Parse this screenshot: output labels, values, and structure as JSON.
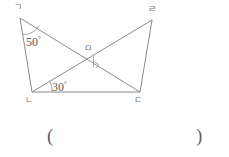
{
  "figure": {
    "title": "",
    "vertices": [
      {
        "id": "top-left",
        "label": "ㄱ",
        "x": 20,
        "y": 18,
        "label_x": 14,
        "label_y": 3
      },
      {
        "id": "top-right",
        "label": "ㄹ",
        "x": 152,
        "y": 20,
        "label_x": 148,
        "label_y": 5
      },
      {
        "id": "bottom-left",
        "label": "ㄴ",
        "x": 32,
        "y": 92,
        "label_x": 25,
        "label_y": 96
      },
      {
        "id": "bottom-right",
        "label": "ㄷ",
        "x": 140,
        "y": 92,
        "label_x": 134,
        "label_y": 96
      },
      {
        "id": "intersection",
        "label": "ㅁ",
        "x": 88,
        "y": 58,
        "label_x": 84,
        "label_y": 44
      }
    ],
    "segments": [
      {
        "id": "seg-gn",
        "from": "top-left",
        "to": "bottom-left"
      },
      {
        "id": "seg-gd",
        "from": "top-left",
        "to": "bottom-right"
      },
      {
        "id": "seg-nd",
        "from": "bottom-left",
        "to": "bottom-right"
      },
      {
        "id": "seg-nr",
        "from": "bottom-left",
        "to": "top-right"
      },
      {
        "id": "seg-rd",
        "from": "top-right",
        "to": "bottom-right"
      }
    ],
    "angles": [
      {
        "id": "angle-50",
        "value": "50",
        "degree_symbol": "°",
        "x": 26,
        "y": 33
      },
      {
        "id": "angle-30",
        "value": "30",
        "degree_symbol": "°",
        "x": 52,
        "y": 78
      }
    ],
    "right_angle_marker": {
      "id": "right-angle-mark",
      "x": 88,
      "y": 58
    },
    "line_color": "#8a8a8a",
    "label_color": "#6f6f6f",
    "angle_text_color": "#5a5a5a"
  },
  "answer_blank": {
    "open_paren": "(",
    "close_paren": ")",
    "open_x": 47,
    "open_y": 126,
    "close_x": 196,
    "close_y": 126
  }
}
